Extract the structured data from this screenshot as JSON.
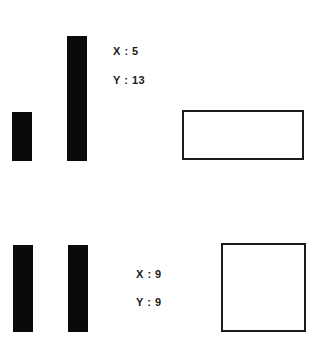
{
  "panels": [
    {
      "bars": [
        {
          "left": 12,
          "top": 112,
          "width": 20,
          "height": 49
        },
        {
          "left": 67,
          "top": 36,
          "width": 20,
          "height": 125
        }
      ],
      "x_label": "X : 5",
      "y_label": "Y : 13",
      "x_value": 5,
      "y_value": 13,
      "label_pos": {
        "left": 113,
        "x_top": 45,
        "y_top": 74
      },
      "shape": {
        "type": "rectangle",
        "left": 182,
        "top": 110,
        "width": 122,
        "height": 50
      }
    },
    {
      "bars": [
        {
          "left": 13,
          "top": 245,
          "width": 20,
          "height": 87
        },
        {
          "left": 68,
          "top": 245,
          "width": 20,
          "height": 87
        }
      ],
      "x_label": "X : 9",
      "y_label": "Y : 9",
      "x_value": 9,
      "y_value": 9,
      "label_pos": {
        "left": 136,
        "x_top": 268,
        "y_top": 296
      },
      "shape": {
        "type": "square",
        "left": 221,
        "top": 243,
        "width": 85,
        "height": 89
      }
    }
  ],
  "colors": {
    "bar": "#0a0a0a",
    "outline": "#1a1a1a",
    "background": "#ffffff"
  }
}
